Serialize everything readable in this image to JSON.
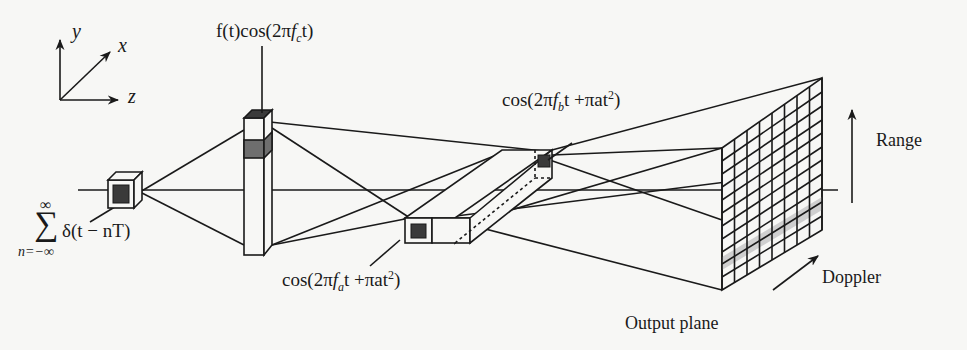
{
  "diagram": {
    "axes": {
      "y": "y",
      "x": "x",
      "z": "z"
    },
    "labels": {
      "input_pulse_train": {
        "sum_top": "∞",
        "sum_symbol": "∑",
        "sum_bottom": "n=−∞",
        "body": "δ(t − nT)"
      },
      "modulator_signal": {
        "prefix": "f(t)cos(2π",
        "f": "f",
        "sub": "c",
        "suffix": "t)"
      },
      "chirp_b": {
        "prefix": "cos(2π",
        "f": "f",
        "sub": "b",
        "mid": "t +πat",
        "sup": "2",
        "suffix": ")"
      },
      "chirp_a": {
        "prefix": "cos(2π",
        "f": "f",
        "sub": "a",
        "mid": "t +πat",
        "sup": "2",
        "suffix": ")"
      },
      "range": "Range",
      "doppler": "Doppler",
      "output_plane": "Output plane"
    },
    "components": [
      "Pulsed source (cube)",
      "Signal modulator (vertical column)",
      "Chirp modulator pair (long prism, fa and fb cells)",
      "Output plane detector grid"
    ],
    "output_grid": {
      "columns": 8,
      "rows": 11
    },
    "colors": {
      "ink": "#1a1a1a",
      "paper": "#f7f7f5",
      "dark_fill": "#3a3a3a",
      "shade": "#7a7a7a",
      "light_shade": "#cfcfcf"
    }
  }
}
